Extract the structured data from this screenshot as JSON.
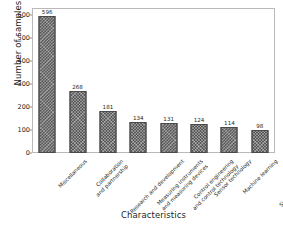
{
  "chart_data": {
    "type": "bar",
    "title": "",
    "subtitle": "",
    "xlabel": "Characteristics",
    "ylabel": "Number of samples",
    "categories": [
      "Miscellaneous",
      "Collaboration\nand partnership",
      "Research and development",
      "Measuring instruments\nand measuring devices",
      "Control engineering\nand control technology",
      "Sensor technology",
      "Machine learning",
      "Simulated development\nand virtualization"
    ],
    "values": [
      596,
      268,
      181,
      134,
      131,
      124,
      114,
      98
    ],
    "data_labels": [
      "596",
      "268",
      "181",
      "134",
      "131",
      "124",
      "114",
      "98"
    ],
    "ylim": [
      0,
      630
    ],
    "yticks": [
      0,
      100,
      200,
      300,
      400,
      500,
      600
    ],
    "ytick_labels": [
      "0",
      "100",
      "200",
      "300",
      "400",
      "500",
      "600"
    ],
    "grid": false,
    "legend": null,
    "legend_position": "none",
    "bar_color": "#585858",
    "bar_hatch": "cross-hatch",
    "text_color": "#231f20",
    "frame_color": "#b9b9bb",
    "background": "#ffffff"
  }
}
